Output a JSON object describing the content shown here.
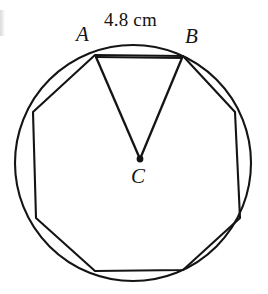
{
  "figure": {
    "background_color": "#ffffff",
    "stroke_color": "#141414",
    "labels": {
      "vertex_a": "A",
      "vertex_b": "B",
      "center_c": "C",
      "side_measure": "4.8 cm"
    },
    "geometry": {
      "circle": {
        "cx": 133,
        "cy": 163,
        "r": 118
      },
      "center_dot": {
        "cx": 140,
        "cy": 159,
        "r": 3.2
      },
      "polygon_sides": 8,
      "polygon_points": "95,55 183,56 235,112 240,218 183,270 95,271 36,218 33,112",
      "chord_ab": {
        "x1": 95,
        "y1": 57,
        "x2": 183,
        "y2": 58
      },
      "radius_ca": {
        "x1": 140,
        "y1": 159,
        "x2": 96,
        "y2": 57
      },
      "radius_cb": {
        "x1": 140,
        "y1": 159,
        "x2": 182,
        "y2": 58
      }
    }
  }
}
